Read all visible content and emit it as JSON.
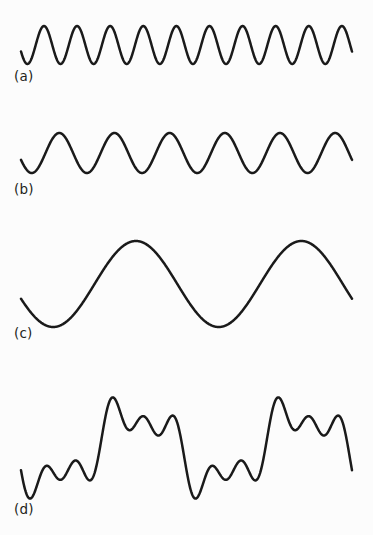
{
  "figure": {
    "width": 373,
    "height": 535,
    "background_color": "#fcfcfc",
    "stroke_color": "#1a1a1a",
    "stroke_width": 2.5
  },
  "labels": {
    "a": "(a)",
    "b": "(b)",
    "c": "(c)",
    "d": "(d)"
  },
  "chart_data": {
    "type": "line",
    "title": "",
    "xlabel": "",
    "ylabel": "",
    "grid": false,
    "legend": "none",
    "x": {
      "start_px": 21,
      "end_px": 352,
      "samples": 900
    },
    "panels": [
      {
        "key": "a",
        "label": "(a)",
        "label_x": 14,
        "label_y": 70,
        "waveform": "sine",
        "cycles": 10,
        "amplitude_px": 19,
        "center_y_px": 45,
        "phase_deg": 200,
        "x_start_px": 21,
        "x_end_px": 352,
        "peaks_visible": 10,
        "relative_frequency": 5,
        "description": "Highest frequency component, smallest amplitude"
      },
      {
        "key": "b",
        "label": "(b)",
        "label_x": 14,
        "label_y": 183,
        "waveform": "sine",
        "cycles": 6,
        "amplitude_px": 20,
        "center_y_px": 153,
        "phase_deg": 200,
        "x_start_px": 21,
        "x_end_px": 352,
        "peaks_visible": 6,
        "relative_frequency": 3,
        "description": "Middle frequency component"
      },
      {
        "key": "c",
        "label": "(c)",
        "label_x": 14,
        "label_y": 327,
        "waveform": "sine",
        "cycles": 2,
        "amplitude_px": 43,
        "center_y_px": 284,
        "phase_deg": 200,
        "x_start_px": 21,
        "x_end_px": 352,
        "peaks_visible": 2,
        "relative_frequency": 1,
        "description": "Lowest frequency component, largest amplitude"
      },
      {
        "key": "d",
        "label": "(d)",
        "label_x": 14,
        "label_y": 503,
        "waveform": "superposition",
        "center_y_px": 448,
        "x_start_px": 21,
        "x_end_px": 352,
        "vertical_range_px": [
          390,
          506
        ],
        "components": [
          {
            "source": "a",
            "cycles": 10,
            "amplitude_px": 15,
            "phase_deg": 200
          },
          {
            "source": "b",
            "cycles": 6,
            "amplitude_px": 16,
            "phase_deg": 200
          },
          {
            "source": "c",
            "cycles": 2,
            "amplitude_px": 34,
            "phase_deg": 200
          }
        ],
        "description": "Sum of waveforms (a), (b) and (c)"
      }
    ]
  }
}
